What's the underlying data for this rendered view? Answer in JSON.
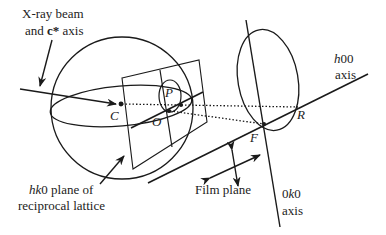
{
  "diagram": {
    "labels": {
      "xray_line1": "X-ray beam",
      "xray_line2_prefix": "and ",
      "xray_line2_bold": "c*",
      "xray_line2_suffix": " axis",
      "hk0_italic": "hk",
      "hk0_rest": "0 plane of",
      "hk0_line2": "reciprocal lattice",
      "h00_italic": "h",
      "h00_rest": "00",
      "h00_line2": "axis",
      "ok0_prefix": "0",
      "ok0_italic": "k",
      "ok0_suffix": "0",
      "ok0_line2": "axis",
      "film_plane": "Film plane"
    },
    "points": {
      "C": "C",
      "O": "O",
      "P": "P",
      "F": "F",
      "R": "R"
    },
    "colors": {
      "stroke": "#1a1a1a",
      "text": "#222222",
      "background": "#ffffff"
    }
  }
}
